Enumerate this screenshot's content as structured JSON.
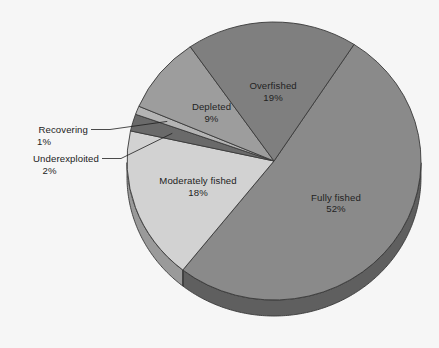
{
  "chart_data": {
    "type": "pie",
    "title": "",
    "subtitle": "",
    "xlabel": "",
    "ylabel": "",
    "three_d": true,
    "legend_position": "none",
    "grid": false,
    "value_suffix": "%",
    "total": 101,
    "categories": [
      "Fully fished",
      "Moderately fished",
      "Underexploited",
      "Recovering",
      "Depleted",
      "Overfished"
    ],
    "values": [
      52,
      18,
      2,
      1,
      9,
      19
    ],
    "labels": [
      "52%",
      "18%",
      "2%",
      "1%",
      "9%",
      "19%"
    ],
    "colors": [
      "#8a8a8a",
      "#d2d2d2",
      "#6a6a6a",
      "#b4b4b4",
      "#9d9d9d",
      "#7f7f7f"
    ],
    "slices": [
      {
        "name": "Fully fished",
        "value": 52,
        "label": "52%",
        "color": "#8a8a8a",
        "side_color": "#5f5f5f",
        "label_placement": "inside"
      },
      {
        "name": "Moderately fished",
        "value": 18,
        "label": "18%",
        "color": "#d2d2d2",
        "side_color": "#9a9a9a",
        "label_placement": "inside"
      },
      {
        "name": "Underexploited",
        "value": 2,
        "label": "2%",
        "color": "#6a6a6a",
        "side_color": "#4d4d4d",
        "label_placement": "callout"
      },
      {
        "name": "Recovering",
        "value": 1,
        "label": "1%",
        "color": "#b4b4b4",
        "side_color": "#808080",
        "label_placement": "callout"
      },
      {
        "name": "Depleted",
        "value": 9,
        "label": "9%",
        "color": "#9d9d9d",
        "side_color": "#727272",
        "label_placement": "inside"
      },
      {
        "name": "Overfished",
        "value": 19,
        "label": "19%",
        "color": "#7f7f7f",
        "side_color": "#585858",
        "label_placement": "inside"
      }
    ],
    "background_color": "#f6f6f6",
    "text_color": "#232323",
    "outline_color": "#3a3a3a"
  }
}
